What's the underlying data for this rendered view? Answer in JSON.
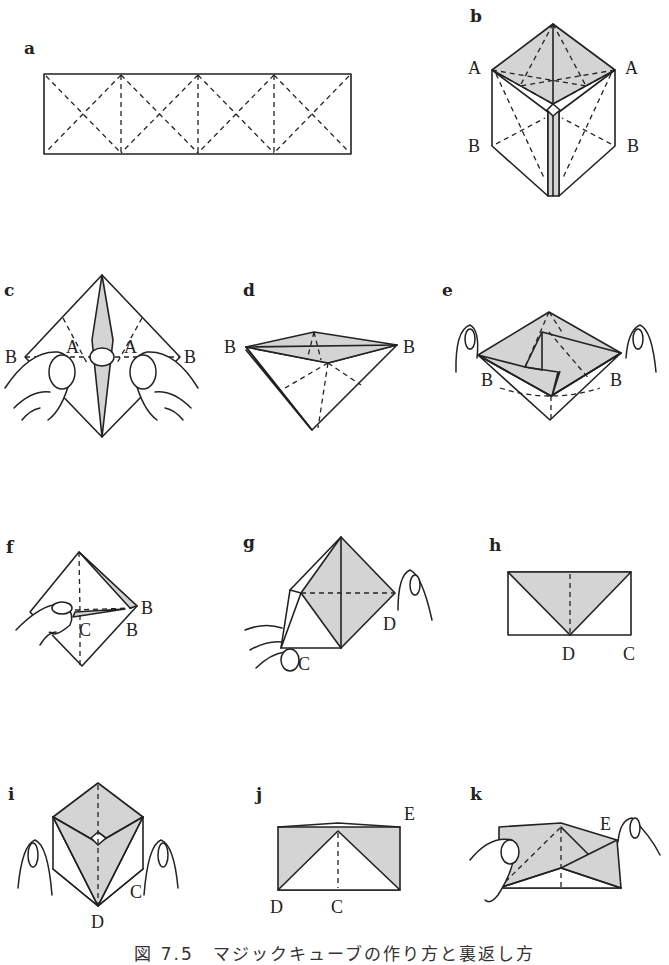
{
  "figure": {
    "caption": "図 7.5　マジックキューブの作り方と裏返し方",
    "colors": {
      "line": "#222222",
      "shade": "#d4d4d4",
      "paper": "#ffffff"
    },
    "panels": [
      {
        "id": "a",
        "label": "a",
        "points": []
      },
      {
        "id": "b",
        "label": "b",
        "points": [
          "A",
          "A",
          "B",
          "B"
        ]
      },
      {
        "id": "c",
        "label": "c",
        "points": [
          "B",
          "A",
          "A",
          "B"
        ]
      },
      {
        "id": "d",
        "label": "d",
        "points": [
          "B",
          "B"
        ]
      },
      {
        "id": "e",
        "label": "e",
        "points": [
          "B",
          "B"
        ]
      },
      {
        "id": "f",
        "label": "f",
        "points": [
          "B",
          "C",
          "B"
        ]
      },
      {
        "id": "g",
        "label": "g",
        "points": [
          "D",
          "C"
        ]
      },
      {
        "id": "h",
        "label": "h",
        "points": [
          "D",
          "C"
        ]
      },
      {
        "id": "i",
        "label": "i",
        "points": [
          "C",
          "D"
        ]
      },
      {
        "id": "j",
        "label": "j",
        "points": [
          "E",
          "D",
          "C"
        ]
      },
      {
        "id": "k",
        "label": "k",
        "points": [
          "E"
        ]
      }
    ]
  }
}
